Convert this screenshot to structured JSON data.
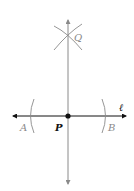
{
  "diagram": {
    "labels": {
      "Q": "Q",
      "line": "ℓ",
      "A": "A",
      "P": "P",
      "B": "B"
    },
    "colors": {
      "line_black": "#111111",
      "construction_gray": "#8a8a8a",
      "label_gray": "#8a8a8a",
      "label_black": "#111111"
    }
  }
}
